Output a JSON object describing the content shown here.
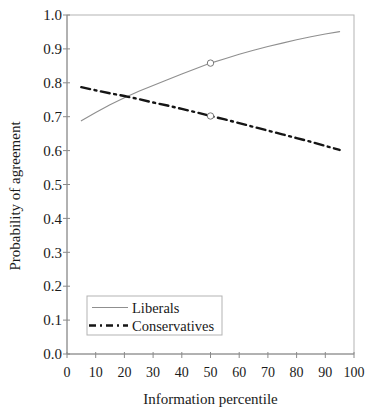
{
  "figure": {
    "background": "#ffffff"
  },
  "chart_data": {
    "type": "line",
    "title": "",
    "xlabel": "Information percentile",
    "ylabel": "Probability of agreement",
    "xlim": [
      0,
      100
    ],
    "ylim": [
      0.0,
      1.0
    ],
    "xticks": [
      0,
      10,
      20,
      30,
      40,
      50,
      60,
      70,
      80,
      90,
      100
    ],
    "yticks": [
      0.0,
      0.1,
      0.2,
      0.3,
      0.4,
      0.5,
      0.6,
      0.7,
      0.8,
      0.9,
      1.0
    ],
    "grid": false,
    "frame": true,
    "axis_color": "#8a8a8a",
    "frame_color": "#b3b3b3",
    "text_color": "#1a1a1a",
    "legend": {
      "position": "lower-left",
      "entries": [
        "Liberals",
        "Conservatives"
      ]
    },
    "series": [
      {
        "name": "Liberals",
        "line_style": "solid",
        "color": "#8f8f8f",
        "line_width": 1.1,
        "x": [
          5,
          10,
          15,
          20,
          25,
          30,
          35,
          40,
          45,
          50,
          55,
          60,
          65,
          70,
          75,
          80,
          85,
          90,
          95
        ],
        "y": [
          0.688,
          0.712,
          0.735,
          0.756,
          0.775,
          0.792,
          0.809,
          0.826,
          0.842,
          0.858,
          0.871,
          0.884,
          0.896,
          0.907,
          0.917,
          0.927,
          0.936,
          0.944,
          0.951
        ],
        "marker": {
          "shape": "open-circle",
          "x": 50,
          "y": 0.858
        }
      },
      {
        "name": "Conservatives",
        "line_style": "dash-dot",
        "color": "#151515",
        "line_width": 2.4,
        "x": [
          5,
          10,
          15,
          20,
          25,
          30,
          35,
          40,
          45,
          50,
          55,
          60,
          65,
          70,
          75,
          80,
          85,
          90,
          95
        ],
        "y": [
          0.787,
          0.778,
          0.769,
          0.761,
          0.752,
          0.742,
          0.733,
          0.723,
          0.713,
          0.702,
          0.692,
          0.681,
          0.67,
          0.659,
          0.648,
          0.637,
          0.626,
          0.614,
          0.602
        ],
        "marker": {
          "shape": "open-circle",
          "x": 50,
          "y": 0.702
        }
      }
    ]
  }
}
